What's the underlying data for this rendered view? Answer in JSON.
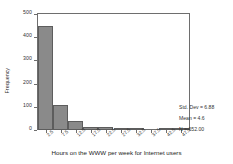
{
  "chart_data": {
    "type": "bar",
    "title": "",
    "subtitle": "",
    "xlabel": "Hours on the WWW per week for Internet users",
    "ylabel": "Frequency",
    "categories": [
      "2.5",
      "7.5",
      "12.5",
      "17.5",
      "22.5",
      "27.5",
      "32.5",
      "37.5",
      "42.5",
      "47.5"
    ],
    "x": [
      2.5,
      7.5,
      12.5,
      17.5,
      22.5,
      27.5,
      32.5,
      37.5,
      42.5,
      47.5
    ],
    "values": [
      448,
      107,
      38,
      12,
      15,
      2,
      1,
      0,
      3,
      1
    ],
    "bin_width": 5,
    "xlim": [
      0,
      50
    ],
    "ylim": [
      0,
      500
    ],
    "yticks": [
      0,
      100,
      200,
      300,
      400,
      500
    ],
    "ytick_labels": [
      "0",
      "100",
      "200",
      "300",
      "400",
      "500"
    ],
    "xtick_labels": [
      "2.5",
      "7.5",
      "12.5",
      "17.5",
      "22.5",
      "27.5",
      "32.5",
      "37.5",
      "42.5",
      "47.5"
    ],
    "grid": false,
    "legend": false,
    "legend_position": "none",
    "bar_color": "#8a8a8a",
    "bar_edge_color": "#5d5d5d",
    "frame_color": "#6e6e6e",
    "annotations": [
      "Std. Dev = 6.88",
      "Mean = 4.6",
      "N = 652.00"
    ]
  },
  "statistics": {
    "std_dev_label": "Std. Dev = 6.88",
    "mean_label": "Mean = 4.6",
    "n_label": "N = 652.00"
  },
  "axes": {
    "y_title": "Frequency",
    "x_title": "Hours on the WWW per week for Internet users"
  }
}
